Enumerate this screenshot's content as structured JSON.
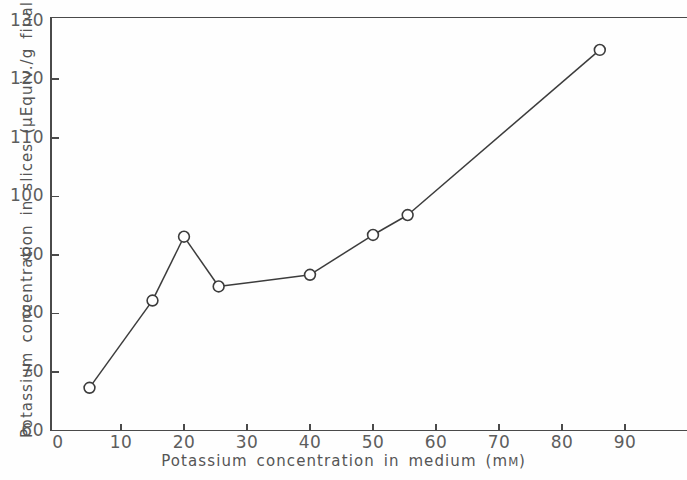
{
  "chart_data": {
    "type": "line",
    "title": "",
    "xlabel": "Potassium concentration in medium (mM)",
    "ylabel": "Potassium concentration in slices (μEquiv./g final wet wt)",
    "xlim": [
      0,
      101
    ],
    "ylim": [
      60,
      130
    ],
    "xticks": [
      0,
      10,
      20,
      30,
      40,
      50,
      60,
      70,
      80,
      90
    ],
    "yticks": [
      60,
      70,
      80,
      90,
      100,
      110,
      120,
      130
    ],
    "grid": false,
    "legend": null,
    "marker": "open-circle",
    "series": [
      {
        "name": "Potassium concentration in slices",
        "x": [
          5,
          15,
          20,
          25.5,
          40,
          50,
          55.5,
          86
        ],
        "values": [
          67.3,
          82.2,
          93.1,
          84.6,
          86.6,
          93.4,
          96.8,
          125.0
        ]
      }
    ]
  },
  "axes": {
    "x_title": "Potassium concentration in medium (m",
    "x_title_unit_smallcap": "M",
    "x_title_close": ")",
    "y_title": "Potassium concentration in slices (μEquiv./g final wet wt)",
    "x_tick_labels": [
      "0",
      "10",
      "20",
      "30",
      "40",
      "50",
      "60",
      "70",
      "80",
      "90"
    ],
    "y_tick_labels": [
      "60",
      "70",
      "80",
      "90",
      "100",
      "110",
      "120",
      "130"
    ]
  },
  "colors": {
    "ink": "#3c3c3c",
    "axis": "#4a4a4a",
    "label": "#555555",
    "tick_label": "#5d5d5d",
    "background": "#fefefe"
  }
}
